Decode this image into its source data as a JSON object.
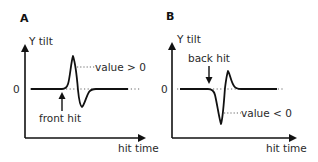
{
  "panels": [
    {
      "letter": "A",
      "y_axis_label": "Y tilt",
      "x_axis_label": "hit time",
      "zero_label": "0",
      "event_label": "front hit",
      "value_label": "value > 0",
      "arrow_direction": "up"
    },
    {
      "letter": "B",
      "y_axis_label": "Y tilt",
      "x_axis_label": "hit time",
      "zero_label": "0",
      "event_label": "back hit",
      "value_label": "value < 0",
      "arrow_direction": "down"
    }
  ],
  "colors": {
    "line": "#111111",
    "dotted": "#555555",
    "text": "#2a2a2a"
  }
}
